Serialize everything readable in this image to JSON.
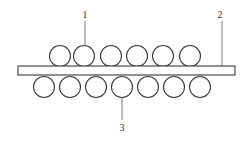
{
  "diagram": {
    "type": "cross-section schematic",
    "colors": {
      "line": "#3a3a3a",
      "background": "#ffffff"
    },
    "plate": {
      "x": 18,
      "y": 66,
      "width": 217,
      "height": 9
    },
    "upper_rollers": {
      "radius": 10.5,
      "cy": 56,
      "centers_x": [
        60,
        84,
        111,
        137,
        163,
        190
      ]
    },
    "lower_rollers": {
      "radius": 10.5,
      "cy": 87,
      "centers_x": [
        44,
        70,
        96,
        122,
        148,
        174,
        200
      ]
    },
    "callouts": [
      {
        "id": "1",
        "label": "1",
        "text_x": 85,
        "text_y": 18,
        "line_x": 85,
        "line_y1": 21,
        "line_y2": 46
      },
      {
        "id": "2",
        "label": "2",
        "text_x": 220,
        "text_y": 18,
        "line_x": 222,
        "line_y1": 21,
        "line_y2": 66
      },
      {
        "id": "3",
        "label": "3",
        "text_x": 122,
        "text_y": 131,
        "line_x": 122,
        "line_y1": 98,
        "line_y2": 120
      }
    ]
  }
}
